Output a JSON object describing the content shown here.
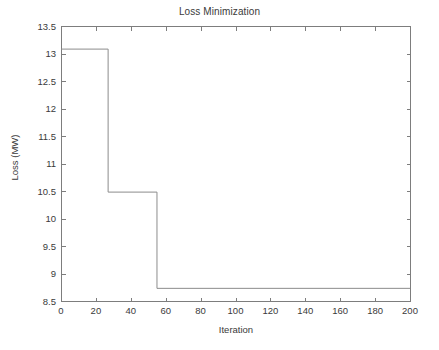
{
  "chart_data": {
    "type": "line",
    "title": "Loss Minimization",
    "xlabel": "Iteration",
    "ylabel": "Loss (MW)",
    "xlim": [
      0,
      200
    ],
    "ylim": [
      8.5,
      13.5
    ],
    "xticks": [
      0,
      20,
      40,
      60,
      80,
      100,
      120,
      140,
      160,
      180,
      200
    ],
    "xtick_labels": [
      "0",
      "20",
      "40",
      "60",
      "80",
      "100",
      "120",
      "140",
      "160",
      "180",
      "200"
    ],
    "yticks": [
      8.5,
      9,
      9.5,
      10,
      10.5,
      11,
      11.5,
      12,
      12.5,
      13,
      13.5
    ],
    "ytick_labels": [
      "8.5",
      "9",
      "9.5",
      "10",
      "10.5",
      "11",
      "11.5",
      "12",
      "12.5",
      "13",
      "13.5"
    ],
    "grid": false,
    "legend": null,
    "line_color": "#8c8c8c",
    "axis_color": "#7d7d7d",
    "background_color": "#ffffff",
    "series": [
      {
        "name": "Loss",
        "step": "post",
        "x": [
          0,
          27,
          27,
          55,
          55,
          200
        ],
        "y": [
          13.08,
          13.08,
          10.48,
          10.48,
          8.73,
          8.73
        ],
        "segments": [
          {
            "from_iteration": 0,
            "to_iteration": 27,
            "loss_mw": 13.08
          },
          {
            "from_iteration": 27,
            "to_iteration": 55,
            "loss_mw": 10.48
          },
          {
            "from_iteration": 55,
            "to_iteration": 200,
            "loss_mw": 8.73
          }
        ]
      }
    ]
  },
  "figure": {
    "plot_box": {
      "left": 61,
      "top": 26,
      "right": 410,
      "bottom": 301
    }
  }
}
